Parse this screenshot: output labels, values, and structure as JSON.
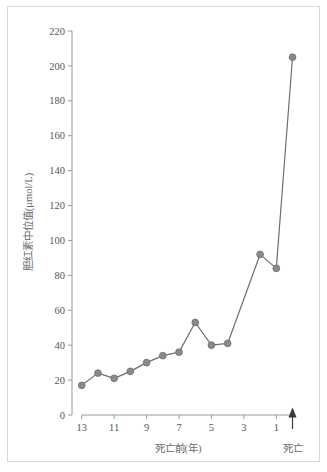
{
  "chart_data": {
    "type": "line",
    "title": "",
    "xlabel": "死亡前(年)",
    "ylabel": "胆红素中位值(μmol/L)",
    "x": [
      13,
      12,
      11,
      10,
      9,
      8,
      7,
      6,
      5,
      4,
      3,
      2,
      1,
      0
    ],
    "values": [
      17,
      24,
      21,
      25,
      30,
      34,
      36,
      53,
      40,
      41,
      null,
      92,
      84,
      205
    ],
    "series": [
      {
        "name": "胆红素中位值",
        "x": [
          13,
          12,
          11,
          10,
          9,
          8,
          7,
          6,
          5,
          4,
          2,
          1,
          0
        ],
        "values": [
          17,
          24,
          21,
          25,
          30,
          34,
          36,
          53,
          40,
          41,
          92,
          84,
          205
        ]
      }
    ],
    "xtick_labels": [
      "13",
      "11",
      "9",
      "7",
      "5",
      "3",
      "1"
    ],
    "xtick_values": [
      13,
      11,
      9,
      7,
      5,
      3,
      1
    ],
    "ytick_labels": [
      "0",
      "20",
      "40",
      "60",
      "80",
      "100",
      "120",
      "140",
      "160",
      "180",
      "200",
      "220"
    ],
    "ytick_values": [
      0,
      20,
      40,
      60,
      80,
      100,
      120,
      140,
      160,
      180,
      200,
      220
    ],
    "xlim": [
      13.6,
      -0.4
    ],
    "ylim": [
      0,
      220
    ],
    "grid": false,
    "legend": false,
    "x_axis_direction": "reversed",
    "marker": "circle",
    "annotations": [
      {
        "name": "death-marker",
        "label": "死亡",
        "x": 0,
        "icon": "up-arrow-icon"
      }
    ],
    "colors": {
      "line": "#6e6e6e",
      "marker": "#8a8a8a",
      "axis": "#9a9a9a",
      "tick_text": "#555555",
      "axis_title": "#6a6a6a",
      "arrow": "#3a3a3a",
      "frame": "#d8d8d8",
      "background": "#ffffff"
    }
  }
}
